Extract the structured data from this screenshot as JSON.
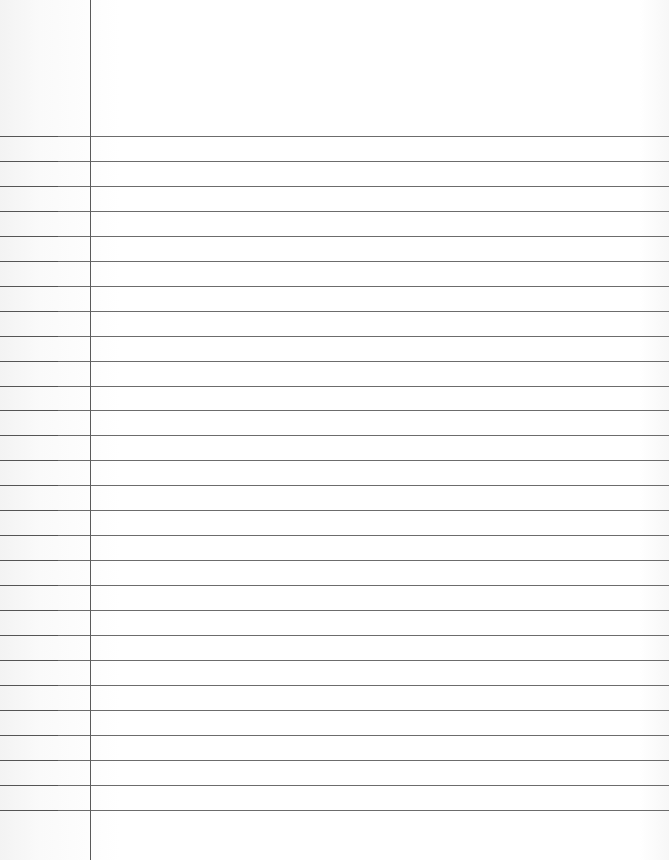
{
  "page": {
    "type": "blank ruled notebook paper",
    "background_color": "#ffffff",
    "rule_color": "#6c6c6c",
    "margin_line_color": "#5a5a5a",
    "margin_x": 90,
    "first_rule_y": 136,
    "rule_spacing": 24.95,
    "rule_count": 28
  }
}
